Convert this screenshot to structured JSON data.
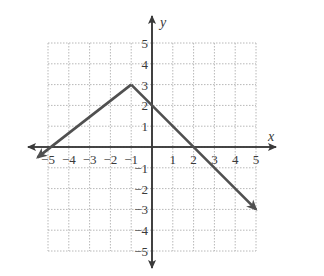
{
  "chart_data": {
    "type": "line",
    "title": "",
    "xlabel": "x",
    "ylabel": "y",
    "xlim": [
      -5,
      5
    ],
    "ylim": [
      -5,
      5
    ],
    "grid": true,
    "x_ticks": [
      "-5",
      "-4",
      "-3",
      "-2",
      "-1",
      "1",
      "2",
      "3",
      "4",
      "5"
    ],
    "y_ticks": [
      "5",
      "4",
      "3",
      "2",
      "1",
      "-1",
      "-2",
      "-3",
      "-4",
      "-5"
    ],
    "series": [
      {
        "name": "piecewise linear (absolute value shape)",
        "points": [
          [
            -5.5,
            -0.5
          ],
          [
            -1,
            3
          ],
          [
            5,
            -3
          ]
        ],
        "vertex": [
          -1,
          3
        ],
        "x_intercepts": [
          -4,
          2
        ],
        "y_intercept": 2,
        "arrows_both_ends": true
      }
    ]
  },
  "colors": {
    "line": "#505050",
    "axis": "#3a3a3a",
    "grid": "#b8b8b8"
  }
}
